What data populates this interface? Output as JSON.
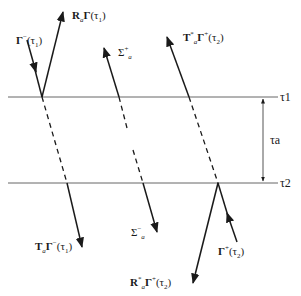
{
  "diagram": {
    "lines": {
      "top_label": "τ1",
      "bottom_label": "τ2",
      "gap_label": "τa"
    },
    "labels": {
      "gamma_minus_tau1": {
        "main": "Γ",
        "sup": "−",
        "arg": "(τ",
        "argsub": "1",
        "close": ")"
      },
      "R_gamma_tau1": {
        "main": "R",
        "sub": "a",
        "main2": "Γ",
        "arg": "(τ",
        "argsub": "1",
        "close": ")"
      },
      "sigma_plus": {
        "main": "Σ",
        "sup": "+",
        "sub": "a"
      },
      "T_star_gamma_plus_tau2": {
        "main": "T",
        "sup": "*",
        "sub": "a",
        "main2": "Γ",
        "sup2": "+",
        "arg": "(τ",
        "argsub": "2",
        "close": ")"
      },
      "T_gamma_minus_tau1": {
        "main": "T",
        "sub": "a",
        "main2": "Γ",
        "sup2": "−",
        "arg": "(τ",
        "argsub": "1",
        "close": ")"
      },
      "sigma_minus": {
        "main": "Σ",
        "sup": "−",
        "sub": "a"
      },
      "R_star_gamma_plus_tau2": {
        "main": "R",
        "sup": "*",
        "sub": "a",
        "main2": "Γ",
        "sup2": "+",
        "arg": "(τ",
        "argsub": "2",
        "close": ")"
      },
      "gamma_plus_tau2": {
        "main": "Γ",
        "sup": "+",
        "arg": "(τ",
        "argsub": "2",
        "close": ")"
      }
    },
    "colors": {
      "line": "#1a1a1a",
      "horizontal": "#555555"
    }
  }
}
